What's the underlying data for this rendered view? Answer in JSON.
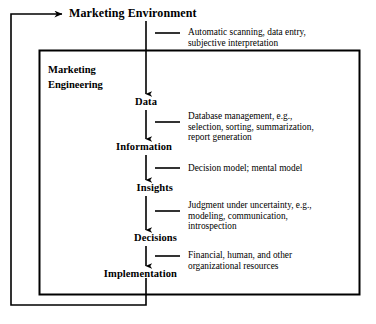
{
  "diagram": {
    "title": "Marketing Environment",
    "inner_box_title": "Marketing\nEngineering",
    "stages": [
      {
        "id": "data",
        "label": "Data"
      },
      {
        "id": "information",
        "label": "Information"
      },
      {
        "id": "insights",
        "label": "Insights"
      },
      {
        "id": "decisions",
        "label": "Decisions"
      },
      {
        "id": "implementation",
        "label": "Implementation"
      }
    ],
    "annotations": [
      {
        "id": "scanning",
        "text": "Automatic scanning, data entry,\nsubjective interpretation"
      },
      {
        "id": "database",
        "text": "Database management, e.g.,\nselection, sorting, summarization,\nreport generation"
      },
      {
        "id": "decision-model",
        "text": "Decision model; mental model"
      },
      {
        "id": "judgment",
        "text": "Judgment under uncertainty, e.g.,\nmodeling, communication,\nintrospection"
      },
      {
        "id": "resources",
        "text": "Financial, human, and other\norganizational resources"
      }
    ],
    "colors": {
      "line": "#000000",
      "text": "#000000",
      "background": "#ffffff"
    }
  }
}
